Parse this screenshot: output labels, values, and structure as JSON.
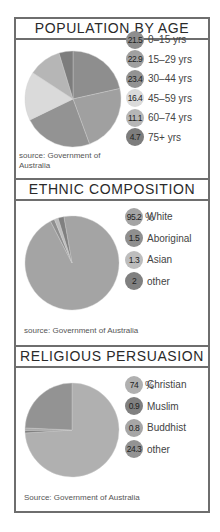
{
  "panels": [
    {
      "title": "POPULATION BY AGE",
      "percent_symbol": "%",
      "source": "source: Government of Australia",
      "source_line1": "source: Government of",
      "source_line2": "Australia",
      "items": [
        {
          "value": "21.5",
          "label": "0–15 yrs",
          "color": "#8e8e8e"
        },
        {
          "value": "22.9",
          "label": "15–29 yrs",
          "color": "#a0a0a0"
        },
        {
          "value": "23.4",
          "label": "30–44 yrs",
          "color": "#939393"
        },
        {
          "value": "16.4",
          "label": "45–59 yrs",
          "color": "#dadada"
        },
        {
          "value": "11.1",
          "label": "60–74 yrs",
          "color": "#b6b6b6"
        },
        {
          "value": "4.7",
          "label": "75+ yrs",
          "color": "#7d7d7d"
        }
      ]
    },
    {
      "title": "ETHNIC COMPOSITION",
      "percent_symbol": "%",
      "source": "source: Government of Australia",
      "items": [
        {
          "value": "95.2",
          "label": "White",
          "color": "#a4a4a4"
        },
        {
          "value": "1.5",
          "label": "Aboriginal",
          "color": "#8f8f8f"
        },
        {
          "value": "1.3",
          "label": "Asian",
          "color": "#bdbdbd"
        },
        {
          "value": "2",
          "label": "other",
          "color": "#808080"
        }
      ]
    },
    {
      "title": "RELIGIOUS PERSUASION",
      "percent_symbol": "%",
      "source": "Source: Government of Australia",
      "items": [
        {
          "value": "74",
          "label": "Christian",
          "color": "#b0b0b0"
        },
        {
          "value": "0.9",
          "label": "Muslim",
          "color": "#808080"
        },
        {
          "value": "0.8",
          "label": "Buddhist",
          "color": "#a6a6a6"
        },
        {
          "value": "24.3",
          "label": "other",
          "color": "#939393"
        }
      ]
    }
  ],
  "chart_data": [
    {
      "type": "pie",
      "title": "POPULATION BY AGE",
      "unit": "%",
      "categories": [
        "0–15 yrs",
        "15–29 yrs",
        "30–44 yrs",
        "45–59 yrs",
        "60–74 yrs",
        "75+ yrs"
      ],
      "values": [
        21.5,
        22.9,
        23.4,
        16.4,
        11.1,
        4.7
      ],
      "annotation": "source: Government of Australia",
      "legend_position": "right"
    },
    {
      "type": "pie",
      "title": "ETHNIC COMPOSITION",
      "unit": "%",
      "categories": [
        "White",
        "Aboriginal",
        "Asian",
        "other"
      ],
      "values": [
        95.2,
        1.5,
        1.3,
        2
      ],
      "annotation": "source: Government of Australia",
      "legend_position": "right"
    },
    {
      "type": "pie",
      "title": "RELIGIOUS PERSUASION",
      "unit": "%",
      "categories": [
        "Christian",
        "Muslim",
        "Buddhist",
        "other"
      ],
      "values": [
        74,
        0.9,
        0.8,
        24.3
      ],
      "annotation": "Source: Government of Australia",
      "legend_position": "right"
    }
  ]
}
